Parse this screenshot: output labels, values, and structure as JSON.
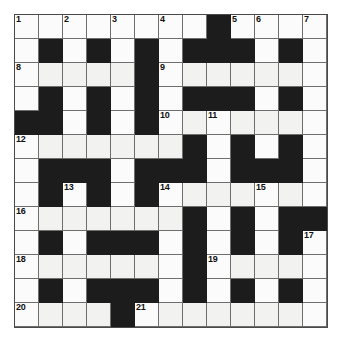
{
  "puzzle": {
    "title": "Crossword Grid",
    "type": "crossword",
    "rows": 13,
    "columns": 13,
    "colors": {
      "block": "#1c1c1c",
      "white": "#fbfbfb",
      "white_shaded": "#f2f2f0",
      "grid_line": "#6e6e6e",
      "border": "#4a4a4a",
      "number_text": "#111111",
      "page_background": "#ffffff"
    },
    "grid": [
      [
        {
          "type": "white",
          "number": "1"
        },
        {
          "type": "white",
          "number": ""
        },
        {
          "type": "white",
          "number": "2"
        },
        {
          "type": "white",
          "number": ""
        },
        {
          "type": "white",
          "number": "3"
        },
        {
          "type": "white",
          "number": ""
        },
        {
          "type": "white",
          "number": "4"
        },
        {
          "type": "white",
          "number": ""
        },
        {
          "type": "block",
          "number": ""
        },
        {
          "type": "white",
          "number": "5"
        },
        {
          "type": "white",
          "number": "6"
        },
        {
          "type": "white",
          "number": ""
        },
        {
          "type": "white",
          "number": "7"
        }
      ],
      [
        {
          "type": "white",
          "number": ""
        },
        {
          "type": "block",
          "number": ""
        },
        {
          "type": "white",
          "number": ""
        },
        {
          "type": "block",
          "number": ""
        },
        {
          "type": "white",
          "number": ""
        },
        {
          "type": "block",
          "number": ""
        },
        {
          "type": "white",
          "number": ""
        },
        {
          "type": "block",
          "number": ""
        },
        {
          "type": "block",
          "number": ""
        },
        {
          "type": "block",
          "number": ""
        },
        {
          "type": "white",
          "number": ""
        },
        {
          "type": "block",
          "number": ""
        },
        {
          "type": "white",
          "number": ""
        }
      ],
      [
        {
          "type": "white",
          "number": "8"
        },
        {
          "type": "whiteb",
          "number": ""
        },
        {
          "type": "whiteb",
          "number": ""
        },
        {
          "type": "whiteb",
          "number": ""
        },
        {
          "type": "whiteb",
          "number": ""
        },
        {
          "type": "block",
          "number": ""
        },
        {
          "type": "white",
          "number": "9"
        },
        {
          "type": "whiteb",
          "number": ""
        },
        {
          "type": "whiteb",
          "number": ""
        },
        {
          "type": "whiteb",
          "number": ""
        },
        {
          "type": "whiteb",
          "number": ""
        },
        {
          "type": "whiteb",
          "number": ""
        },
        {
          "type": "white",
          "number": ""
        }
      ],
      [
        {
          "type": "white",
          "number": ""
        },
        {
          "type": "block",
          "number": ""
        },
        {
          "type": "white",
          "number": ""
        },
        {
          "type": "block",
          "number": ""
        },
        {
          "type": "white",
          "number": ""
        },
        {
          "type": "block",
          "number": ""
        },
        {
          "type": "white",
          "number": ""
        },
        {
          "type": "block",
          "number": ""
        },
        {
          "type": "block",
          "number": ""
        },
        {
          "type": "block",
          "number": ""
        },
        {
          "type": "white",
          "number": ""
        },
        {
          "type": "block",
          "number": ""
        },
        {
          "type": "white",
          "number": ""
        }
      ],
      [
        {
          "type": "block",
          "number": ""
        },
        {
          "type": "block",
          "number": ""
        },
        {
          "type": "white",
          "number": ""
        },
        {
          "type": "block",
          "number": ""
        },
        {
          "type": "white",
          "number": ""
        },
        {
          "type": "block",
          "number": ""
        },
        {
          "type": "white",
          "number": "10"
        },
        {
          "type": "whiteb",
          "number": ""
        },
        {
          "type": "white",
          "number": "11"
        },
        {
          "type": "whiteb",
          "number": ""
        },
        {
          "type": "whiteb",
          "number": ""
        },
        {
          "type": "whiteb",
          "number": ""
        },
        {
          "type": "white",
          "number": ""
        }
      ],
      [
        {
          "type": "white",
          "number": "12"
        },
        {
          "type": "whiteb",
          "number": ""
        },
        {
          "type": "whiteb",
          "number": ""
        },
        {
          "type": "whiteb",
          "number": ""
        },
        {
          "type": "whiteb",
          "number": ""
        },
        {
          "type": "whiteb",
          "number": ""
        },
        {
          "type": "whiteb",
          "number": ""
        },
        {
          "type": "block",
          "number": ""
        },
        {
          "type": "white",
          "number": ""
        },
        {
          "type": "block",
          "number": ""
        },
        {
          "type": "white",
          "number": ""
        },
        {
          "type": "block",
          "number": ""
        },
        {
          "type": "white",
          "number": ""
        }
      ],
      [
        {
          "type": "white",
          "number": ""
        },
        {
          "type": "block",
          "number": ""
        },
        {
          "type": "block",
          "number": ""
        },
        {
          "type": "block",
          "number": ""
        },
        {
          "type": "white",
          "number": ""
        },
        {
          "type": "block",
          "number": ""
        },
        {
          "type": "block",
          "number": ""
        },
        {
          "type": "block",
          "number": ""
        },
        {
          "type": "white",
          "number": ""
        },
        {
          "type": "block",
          "number": ""
        },
        {
          "type": "block",
          "number": ""
        },
        {
          "type": "block",
          "number": ""
        },
        {
          "type": "white",
          "number": ""
        }
      ],
      [
        {
          "type": "white",
          "number": ""
        },
        {
          "type": "block",
          "number": ""
        },
        {
          "type": "white",
          "number": "13"
        },
        {
          "type": "block",
          "number": ""
        },
        {
          "type": "white",
          "number": ""
        },
        {
          "type": "block",
          "number": ""
        },
        {
          "type": "white",
          "number": "14"
        },
        {
          "type": "whiteb",
          "number": ""
        },
        {
          "type": "whiteb",
          "number": ""
        },
        {
          "type": "whiteb",
          "number": ""
        },
        {
          "type": "white",
          "number": "15"
        },
        {
          "type": "whiteb",
          "number": ""
        },
        {
          "type": "white",
          "number": ""
        }
      ],
      [
        {
          "type": "white",
          "number": "16"
        },
        {
          "type": "whiteb",
          "number": ""
        },
        {
          "type": "whiteb",
          "number": ""
        },
        {
          "type": "whiteb",
          "number": ""
        },
        {
          "type": "whiteb",
          "number": ""
        },
        {
          "type": "whiteb",
          "number": ""
        },
        {
          "type": "whiteb",
          "number": ""
        },
        {
          "type": "block",
          "number": ""
        },
        {
          "type": "white",
          "number": ""
        },
        {
          "type": "block",
          "number": ""
        },
        {
          "type": "white",
          "number": ""
        },
        {
          "type": "block",
          "number": ""
        },
        {
          "type": "block",
          "number": ""
        }
      ],
      [
        {
          "type": "white",
          "number": ""
        },
        {
          "type": "block",
          "number": ""
        },
        {
          "type": "white",
          "number": ""
        },
        {
          "type": "block",
          "number": ""
        },
        {
          "type": "block",
          "number": ""
        },
        {
          "type": "block",
          "number": ""
        },
        {
          "type": "white",
          "number": ""
        },
        {
          "type": "block",
          "number": ""
        },
        {
          "type": "white",
          "number": ""
        },
        {
          "type": "block",
          "number": ""
        },
        {
          "type": "white",
          "number": ""
        },
        {
          "type": "block",
          "number": ""
        },
        {
          "type": "white",
          "number": "17"
        }
      ],
      [
        {
          "type": "white",
          "number": "18"
        },
        {
          "type": "whiteb",
          "number": ""
        },
        {
          "type": "whiteb",
          "number": ""
        },
        {
          "type": "whiteb",
          "number": ""
        },
        {
          "type": "whiteb",
          "number": ""
        },
        {
          "type": "whiteb",
          "number": ""
        },
        {
          "type": "white",
          "number": ""
        },
        {
          "type": "block",
          "number": ""
        },
        {
          "type": "white",
          "number": "19"
        },
        {
          "type": "whiteb",
          "number": ""
        },
        {
          "type": "whiteb",
          "number": ""
        },
        {
          "type": "whiteb",
          "number": ""
        },
        {
          "type": "white",
          "number": ""
        }
      ],
      [
        {
          "type": "white",
          "number": ""
        },
        {
          "type": "block",
          "number": ""
        },
        {
          "type": "white",
          "number": ""
        },
        {
          "type": "block",
          "number": ""
        },
        {
          "type": "block",
          "number": ""
        },
        {
          "type": "block",
          "number": ""
        },
        {
          "type": "white",
          "number": ""
        },
        {
          "type": "block",
          "number": ""
        },
        {
          "type": "white",
          "number": ""
        },
        {
          "type": "block",
          "number": ""
        },
        {
          "type": "white",
          "number": ""
        },
        {
          "type": "block",
          "number": ""
        },
        {
          "type": "white",
          "number": ""
        }
      ],
      [
        {
          "type": "white",
          "number": "20"
        },
        {
          "type": "whiteb",
          "number": ""
        },
        {
          "type": "whiteb",
          "number": ""
        },
        {
          "type": "whiteb",
          "number": ""
        },
        {
          "type": "block",
          "number": ""
        },
        {
          "type": "white",
          "number": "21"
        },
        {
          "type": "whiteb",
          "number": ""
        },
        {
          "type": "whiteb",
          "number": ""
        },
        {
          "type": "whiteb",
          "number": ""
        },
        {
          "type": "whiteb",
          "number": ""
        },
        {
          "type": "whiteb",
          "number": ""
        },
        {
          "type": "whiteb",
          "number": ""
        },
        {
          "type": "white",
          "number": ""
        }
      ]
    ]
  }
}
